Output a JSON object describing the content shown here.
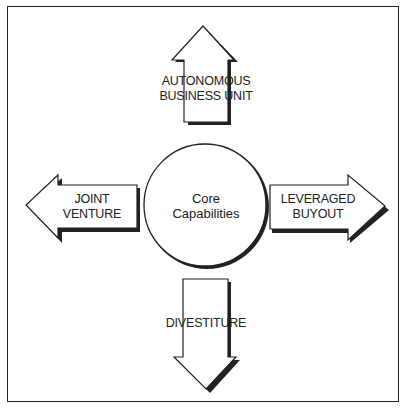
{
  "figure": {
    "caption_partial": "Figure — Leveraging Core Capabilities (caption cut off)",
    "center": {
      "line1": "Core",
      "line2": "Capabilities"
    },
    "arrows": {
      "up": {
        "line1": "AUTONOMOUS",
        "line2": "BUSINESS UNIT"
      },
      "left": {
        "line1": "JOINT",
        "line2": "VENTURE"
      },
      "right": {
        "line1": "LEVERAGED",
        "line2": "BUYOUT"
      },
      "down": {
        "line1": "DIVESTITURE"
      }
    },
    "colors": {
      "ink": "#222222",
      "background": "#ffffff"
    }
  }
}
